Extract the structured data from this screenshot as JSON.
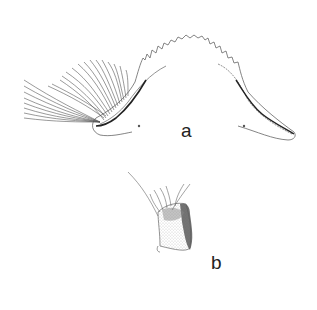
{
  "figure": {
    "panels": [
      {
        "id": "a",
        "label": "a",
        "subject": "labrum with setae fringe and toothed margin"
      },
      {
        "id": "b",
        "label": "b",
        "subject": "palp segment with setae"
      }
    ],
    "colors": {
      "background": "#ffffff",
      "line": "#555555",
      "dark_line": "#222222",
      "stipple": "#9a9a9a",
      "shade": "#555555"
    }
  }
}
